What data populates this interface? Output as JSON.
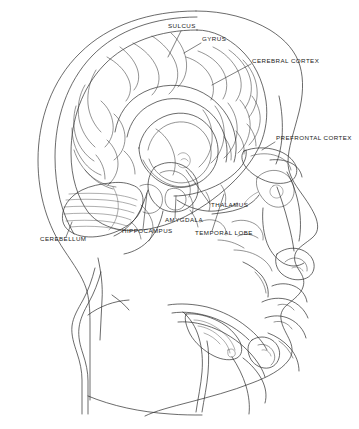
{
  "diagram": {
    "kind": "anatomical-line-drawing",
    "view": "lateral profile, facing right",
    "background_color": "#ffffff",
    "line_color": "#2b2b2b",
    "text_color": "#1a1a1a"
  },
  "labels": [
    {
      "id": "sulcus",
      "text": "SULCUS",
      "text_x": 168,
      "text_y": 28,
      "anchor": "start",
      "leader": "M 181 31 L 168 57"
    },
    {
      "id": "gyrus",
      "text": "GYRUS",
      "text_x": 202,
      "text_y": 41,
      "anchor": "start",
      "leader": "M 201 43 L 184 53"
    },
    {
      "id": "cerebral-cortex",
      "text": "CEREBRAL CORTEX",
      "text_x": 252,
      "text_y": 63,
      "anchor": "start",
      "leader": "M 251 64 L 212 85"
    },
    {
      "id": "prefrontal-cortex",
      "text": "PREFRONTAL CORTEX",
      "text_x": 276,
      "text_y": 140,
      "anchor": "start",
      "leader": "M 275 142 L 262 150"
    },
    {
      "id": "thalamus",
      "text": "THALAMUS",
      "text_x": 211,
      "text_y": 207,
      "anchor": "start",
      "leader": "M 210 204 L 186 170"
    },
    {
      "id": "amygdala",
      "text": "AMYGDALA",
      "text_x": 165,
      "text_y": 222,
      "anchor": "start",
      "leader": "M 175 218 L 176 196"
    },
    {
      "id": "temporal-lobe",
      "text": "TEMPORAL LOBE",
      "text_x": 195,
      "text_y": 235,
      "anchor": "start",
      "leader": "M 212 231 L 224 194"
    },
    {
      "id": "hippocampus",
      "text": "HIPPOCAMPUS",
      "text_x": 122,
      "text_y": 233,
      "anchor": "start",
      "leader": "M 143 229 L 147 193"
    },
    {
      "id": "cerebellum",
      "text": "CEREBELLUM",
      "text_x": 40,
      "text_y": 241,
      "anchor": "start",
      "leader": "M 66 237 L 72 222"
    }
  ]
}
